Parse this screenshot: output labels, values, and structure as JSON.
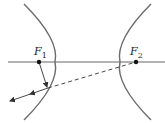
{
  "diagram": {
    "type": "hyperbola-reflection",
    "colors": {
      "curve": "#6b6b6b",
      "line": "#333333",
      "point": "#111111",
      "background": "#ffffff"
    },
    "foci": [
      {
        "label": "F",
        "sub": "1",
        "x": 39,
        "y": 62
      },
      {
        "label": "F",
        "sub": "2",
        "x": 136,
        "y": 62
      }
    ],
    "reflection_point": {
      "x": 48,
      "y": 88
    },
    "reflected_ray_end": {
      "x": 10,
      "y": 101
    }
  }
}
